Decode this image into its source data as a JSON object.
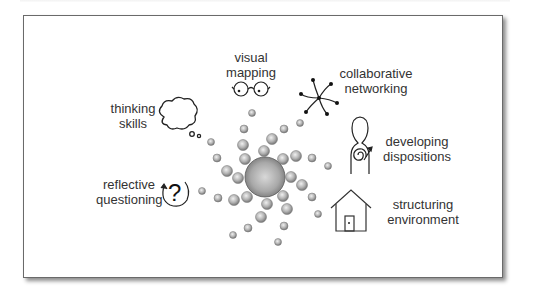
{
  "diagram": {
    "center": {
      "label": "",
      "x": 265,
      "y": 177,
      "r": 20
    },
    "nodes": [
      {
        "id": "visual-mapping",
        "lines": [
          "visual",
          "mapping"
        ],
        "icon": "glasses-icon"
      },
      {
        "id": "collaborative-networking",
        "lines": [
          "collaborative",
          "networking"
        ],
        "icon": "network-icon"
      },
      {
        "id": "thinking-skills",
        "lines": [
          "thinking",
          "skills"
        ],
        "icon": "thought-cloud-icon"
      },
      {
        "id": "developing-dispositions",
        "lines": [
          "developing",
          "dispositions"
        ],
        "icon": "person-spiral-icon"
      },
      {
        "id": "reflective-questioning",
        "lines": [
          "reflective",
          "questioning"
        ],
        "icon": "question-cycle-icon"
      },
      {
        "id": "structuring-environment",
        "lines": [
          "structuring",
          "environment"
        ],
        "icon": "house-icon"
      }
    ],
    "colors": {
      "frame_border": "#6a6a6a",
      "text": "#333333",
      "sphere_light": "#e6e6e6",
      "sphere_dark": "#7d7d7d",
      "icon_stroke": "#222222"
    }
  }
}
